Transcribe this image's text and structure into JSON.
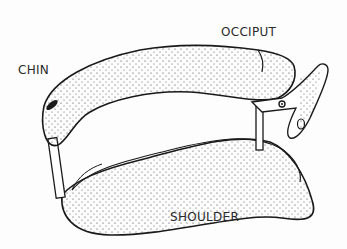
{
  "diagram": {
    "labels": {
      "chin": "CHIN",
      "occiput": "OCCIPUT",
      "shoulder": "SHOULDER"
    },
    "colors": {
      "line": "#1a1a1a",
      "fill": "#ffffff",
      "stipple": "#3a3a3a"
    }
  }
}
